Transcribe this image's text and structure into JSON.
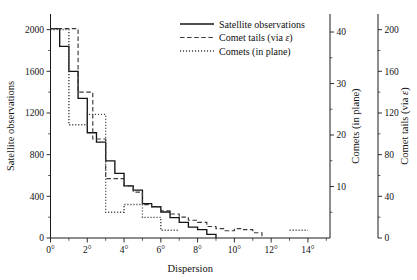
{
  "chart_data": {
    "type": "line",
    "subtype": "step-histogram",
    "title": "",
    "xlabel": "Dispersion",
    "ylabel": "Satellite observations",
    "y2label": "Comets (in plane)",
    "y3label": "Comet tails (via ε)",
    "xlim": [
      0,
      15.2
    ],
    "ylim": [
      0,
      2150
    ],
    "y2lim": [
      0,
      43.5
    ],
    "y3lim": [
      0,
      215
    ],
    "grid": false,
    "legend_position": "top-center",
    "x_tick_labels": [
      "0°",
      "2°",
      "4°",
      "6°",
      "8°",
      "10°",
      "12°",
      "14°"
    ],
    "x_ticks": [
      0,
      2,
      4,
      6,
      8,
      10,
      12,
      14
    ],
    "x_minor_ticks": [
      1,
      3,
      5,
      7,
      9,
      11,
      13,
      15
    ],
    "y_ticks": [
      0,
      400,
      800,
      1200,
      1600,
      2000
    ],
    "y_tick_labels": [
      "0",
      "400",
      "800",
      "1200",
      "1600",
      "2000"
    ],
    "y_minor_ticks": [
      200,
      600,
      1000,
      1400,
      1800
    ],
    "y2_ticks": [
      10,
      20,
      30,
      40
    ],
    "y2_tick_labels": [
      "10",
      "20",
      "30",
      "40"
    ],
    "y2_minor_ticks": [
      5,
      15,
      25,
      35
    ],
    "y3_ticks": [
      0,
      40,
      80,
      120,
      160,
      200
    ],
    "y3_tick_labels": [
      "0",
      "40",
      "80",
      "120",
      "160",
      "200"
    ],
    "y3_minor_ticks": [
      20,
      60,
      100,
      140,
      180
    ],
    "series": [
      {
        "name": "Satellite observations",
        "style": "solid",
        "axis": "left",
        "edges": [
          0,
          0.5,
          1.0,
          1.5,
          2.0,
          2.5,
          3.0,
          3.5,
          4.0,
          4.5,
          5.0,
          5.5,
          6.0,
          6.5,
          7.0,
          7.5,
          8.0,
          8.5,
          9.0
        ],
        "values": [
          2010,
          1840,
          1600,
          1340,
          1010,
          920,
          740,
          620,
          500,
          460,
          330,
          300,
          250,
          195,
          150,
          105,
          80,
          35
        ]
      },
      {
        "name": "Comet tails (via ε)",
        "style": "dashed",
        "axis": "right-outer",
        "edges": [
          0,
          1.5,
          2.3,
          3.0,
          4.0,
          4.5,
          5.0,
          5.5,
          6.0,
          6.5,
          7.0,
          7.5,
          8.0,
          8.5,
          9.0,
          9.5,
          10.0,
          10.5,
          11.0,
          11.5
        ],
        "values": [
          201,
          140,
          95,
          57,
          50,
          44,
          32,
          30,
          26,
          23,
          20,
          17,
          15,
          11,
          9,
          7,
          9,
          8,
          5
        ]
      },
      {
        "name": "Comets (in plane)",
        "style": "dotted",
        "axis": "right-inner",
        "edges": [
          0,
          1.0,
          2.0,
          3.0,
          4.0,
          5.0,
          6.0,
          7.0,
          13.0,
          14.0
        ],
        "values": [
          40.5,
          22,
          24,
          5,
          6.5,
          4,
          1.5,
          0,
          1.5
        ]
      }
    ]
  },
  "legend": {
    "items": [
      {
        "label": "Satellite observations",
        "style": "solid"
      },
      {
        "label": "Comet tails (via ε)",
        "style": "dashed"
      },
      {
        "label": "Comets (in plane)",
        "style": "dotted"
      }
    ]
  },
  "colors": {
    "axis": "#1a1a1a",
    "text": "#111111",
    "solid": "#141414",
    "dashed": "#3a3a3a",
    "dotted": "#3a3a3a",
    "background": "#ffffff"
  }
}
